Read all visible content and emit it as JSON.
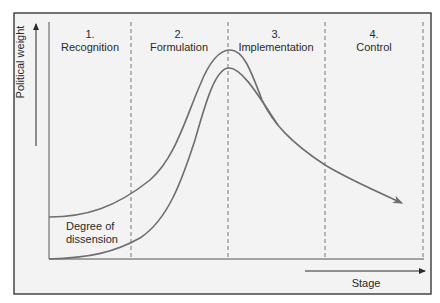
{
  "diagram": {
    "y_axis_label": "Political weight",
    "x_axis_label": "Stage",
    "curve_label_line1": "Degree of",
    "curve_label_line2": "dissension",
    "stages": [
      {
        "number": "1.",
        "name": "Recognition"
      },
      {
        "number": "2.",
        "name": "Formulation"
      },
      {
        "number": "3.",
        "name": "Implementation"
      },
      {
        "number": "4.",
        "name": "Control"
      }
    ],
    "colors": {
      "background": "#f3f3f3",
      "frame": "#3a3a3a",
      "curve": "#6e6e6e",
      "divider": "#777777",
      "text": "#2a2a2a"
    }
  }
}
